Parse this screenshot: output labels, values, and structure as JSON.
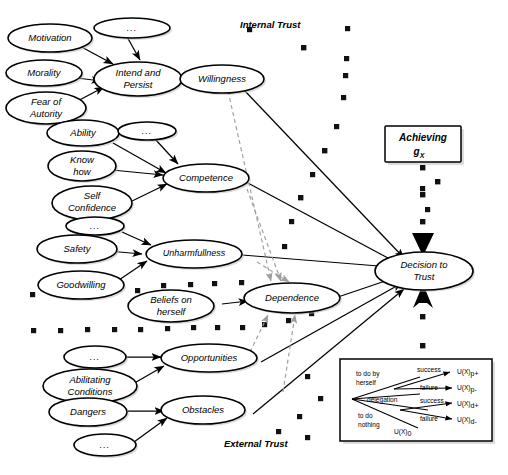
{
  "diagram": {
    "title_internal": "Internal Trust",
    "title_external": "External Trust",
    "goal_box": {
      "line1": "Achieving",
      "line2": "g",
      "sub": "X"
    }
  },
  "nodes": {
    "motivation": "Motivation",
    "morality": "Morality",
    "fear_of_authority": "Fear of\nAutority",
    "dots_top": "...",
    "intend_and_persist": "Intend and\nPersist",
    "willingness": "Willingness",
    "ability": "Ability",
    "dots_ability": "...",
    "know_how": "Know\nhow",
    "self_confidence": "Self\nConfidence",
    "competence": "Competence",
    "dots_safety": "...",
    "safety": "Safety",
    "goodwilling": "Goodwilling",
    "unharmfullness": "Unharmfullness",
    "beliefs_on_herself": "Beliefs on\nherself",
    "dependence": "Dependence",
    "dots_opportunities": "...",
    "abilitating_conditions": "Abilitating\nConditions",
    "opportunities": "Opportunities",
    "dangers": "Dangers",
    "dots_obstacles": "...",
    "obstacles": "Obstacles",
    "decision_to_trust": "Decision to\nTrust"
  },
  "node_lines": {
    "fear_of_authority": [
      "Fear of",
      "Autority"
    ],
    "intend_and_persist": [
      "Intend and",
      "Persist"
    ],
    "know_how": [
      "Know",
      "how"
    ],
    "self_confidence": [
      "Self",
      "Confidence"
    ],
    "beliefs_on_herself": [
      "Beliefs on",
      "herself"
    ],
    "abilitating_conditions": [
      "Abilitating",
      "Conditions"
    ],
    "decision_to_trust": [
      "Decision to",
      "Trust"
    ]
  },
  "decision_tree": {
    "branch_1": [
      "to do by",
      "herself"
    ],
    "branch_2": "delegation",
    "branch_3": [
      "to do",
      "nothing"
    ],
    "outcomes": [
      "success",
      "failure",
      "success",
      "failure"
    ],
    "utilities": [
      {
        "base": "U(X)",
        "sub": "p+"
      },
      {
        "base": "U(X)",
        "sub": "p-"
      },
      {
        "base": "U(X)",
        "sub": "d+"
      },
      {
        "base": "U(X)",
        "sub": "d-"
      }
    ],
    "utility_nothing": {
      "base": "U(X)",
      "sub": "0"
    }
  },
  "colors": {
    "stroke": "#000000",
    "dashed_edge": "#9e9e9e",
    "shadow": "#b9b9b9",
    "background": "#ffffff"
  }
}
